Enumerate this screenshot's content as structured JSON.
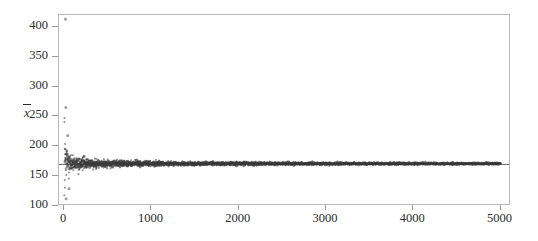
{
  "chart_data": {
    "type": "scatter",
    "title": "",
    "subtitle": "",
    "xlabel": "",
    "ylabel": "x̄",
    "ylabel_plain": "x-bar",
    "xlim": [
      -60,
      5120
    ],
    "ylim": [
      100,
      420
    ],
    "grid": false,
    "legend": null,
    "n_points": 5000,
    "x_ticks": [
      0,
      1000,
      2000,
      3000,
      4000,
      5000
    ],
    "x_tick_labels": [
      "0",
      "1000",
      "2000",
      "3000",
      "4000",
      "5000"
    ],
    "y_ticks": [
      100,
      150,
      200,
      250,
      300,
      350,
      400
    ],
    "y_tick_labels": [
      "100",
      "150",
      "200",
      "250",
      "300",
      "350",
      "400"
    ],
    "reference_line": {
      "orientation": "horizontal",
      "value": 171,
      "label": "population mean",
      "color": "#6f6f6f"
    },
    "marker": {
      "shape": "circle",
      "size_px": 2.1,
      "color": "#3a3a3a",
      "opacity": 0.55,
      "edge_color": "#222222"
    },
    "series": [
      {
        "name": "running mean",
        "color": "#3a3a3a",
        "converges_to": 171,
        "spread_model": {
          "sigma0": 62,
          "exponent": 0.5,
          "note": "half-width of scatter approx sigma0 / sqrt(n)"
        }
      }
    ],
    "notable_points": [
      {
        "x": 14,
        "y": 413,
        "note": "early high outlier"
      },
      {
        "x": 18,
        "y": 265,
        "note": "early high outlier"
      },
      {
        "x": 22,
        "y": 112,
        "note": "early low outlier"
      },
      {
        "x": 40,
        "y": 218,
        "note": "early spread upper"
      },
      {
        "x": 55,
        "y": 129,
        "note": "early spread lower"
      },
      {
        "x": 500,
        "y": 175,
        "note": "band narrowing"
      },
      {
        "x": 2500,
        "y": 172,
        "note": "tight band"
      },
      {
        "x": 5000,
        "y": 171,
        "note": "converged"
      }
    ],
    "axes": {
      "frame_color": "#b9b9b9",
      "tick_color": "#9a9a9a",
      "text_color": "#2b2b2b",
      "background": "#ffffff"
    }
  }
}
